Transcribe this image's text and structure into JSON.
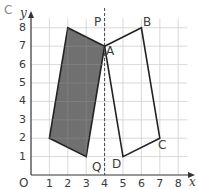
{
  "figure": {
    "corner_label": "C",
    "axes": {
      "x_label": "x",
      "y_label": "y",
      "origin_label": "O",
      "x_ticks": [
        "1",
        "2",
        "3",
        "4",
        "5",
        "6",
        "7",
        "8"
      ],
      "y_ticks": [
        "1",
        "2",
        "3",
        "4",
        "5",
        "6",
        "7",
        "8"
      ],
      "xlim": [
        0,
        8.5
      ],
      "ylim": [
        0,
        8.5
      ],
      "grid": true
    },
    "shapes": {
      "shaded_quad": {
        "vertices": [
          [
            2,
            8
          ],
          [
            4,
            7
          ],
          [
            3,
            1
          ],
          [
            1,
            2
          ]
        ],
        "fill": "#707070"
      },
      "outline_quad": {
        "vertices": [
          [
            4,
            7
          ],
          [
            6,
            8
          ],
          [
            7,
            2
          ],
          [
            5,
            1
          ]
        ],
        "fill": "none"
      }
    },
    "mirror_line": {
      "x": 4,
      "top_label": "P",
      "bottom_label": "Q",
      "style": "dashed"
    },
    "point_labels": [
      {
        "name": "A",
        "x": 4,
        "y": 7
      },
      {
        "name": "B",
        "x": 6,
        "y": 8
      },
      {
        "name": "C",
        "x": 7,
        "y": 2
      },
      {
        "name": "D",
        "x": 5,
        "y": 1
      }
    ],
    "colors": {
      "grid": "#cfcfcf",
      "axis": "#333333",
      "shade": "#707070",
      "text": "#3a3a3a"
    }
  }
}
